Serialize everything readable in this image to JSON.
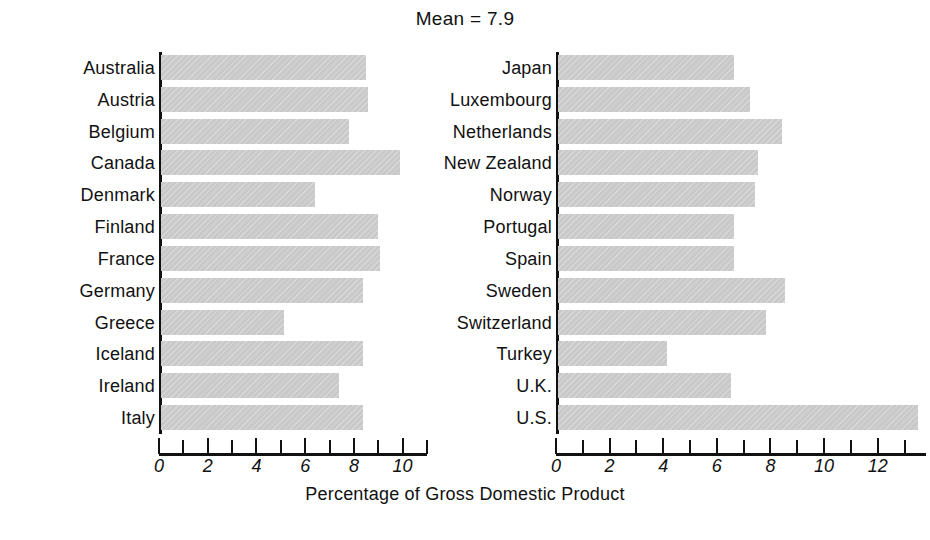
{
  "chart_data": {
    "type": "bar",
    "orientation": "horizontal",
    "title": "Mean = 7.9",
    "xlabel": "Percentage of Gross Domestic Product",
    "ylabel": "",
    "grid": false,
    "legend": null,
    "panels": [
      {
        "name": "left-panel",
        "xlim": [
          0,
          11
        ],
        "xticks": [
          0,
          1,
          2,
          3,
          4,
          5,
          6,
          7,
          8,
          9,
          10,
          11
        ],
        "xtick_labels": [
          "0",
          "",
          "2",
          "",
          "4",
          "",
          "6",
          "",
          "8",
          "",
          "10",
          ""
        ],
        "categories": [
          "Australia",
          "Austria",
          "Belgium",
          "Canada",
          "Denmark",
          "Finland",
          "France",
          "Germany",
          "Greece",
          "Iceland",
          "Ireland",
          "Italy"
        ],
        "values": [
          8.5,
          8.6,
          7.8,
          9.9,
          6.4,
          9.0,
          9.1,
          8.4,
          5.1,
          8.4,
          7.4,
          8.4
        ]
      },
      {
        "name": "right-panel",
        "xlim": [
          0,
          13.8
        ],
        "xticks": [
          0,
          1,
          2,
          3,
          4,
          5,
          6,
          7,
          8,
          9,
          10,
          11,
          12,
          13
        ],
        "xtick_labels": [
          "0",
          "",
          "2",
          "",
          "4",
          "",
          "6",
          "",
          "8",
          "",
          "10",
          "",
          "12",
          ""
        ],
        "categories": [
          "Japan",
          "Luxembourg",
          "Netherlands",
          "New Zealand",
          "Norway",
          "Portugal",
          "Spain",
          "Sweden",
          "Switzerland",
          "Turkey",
          "U.K.",
          "U.S."
        ],
        "values": [
          6.6,
          7.2,
          8.4,
          7.5,
          7.4,
          6.6,
          6.6,
          8.5,
          7.8,
          4.1,
          6.5,
          13.5
        ]
      }
    ],
    "bar_color": "#c9c9c9",
    "axis_color": "#111111",
    "background": "#ffffff"
  }
}
